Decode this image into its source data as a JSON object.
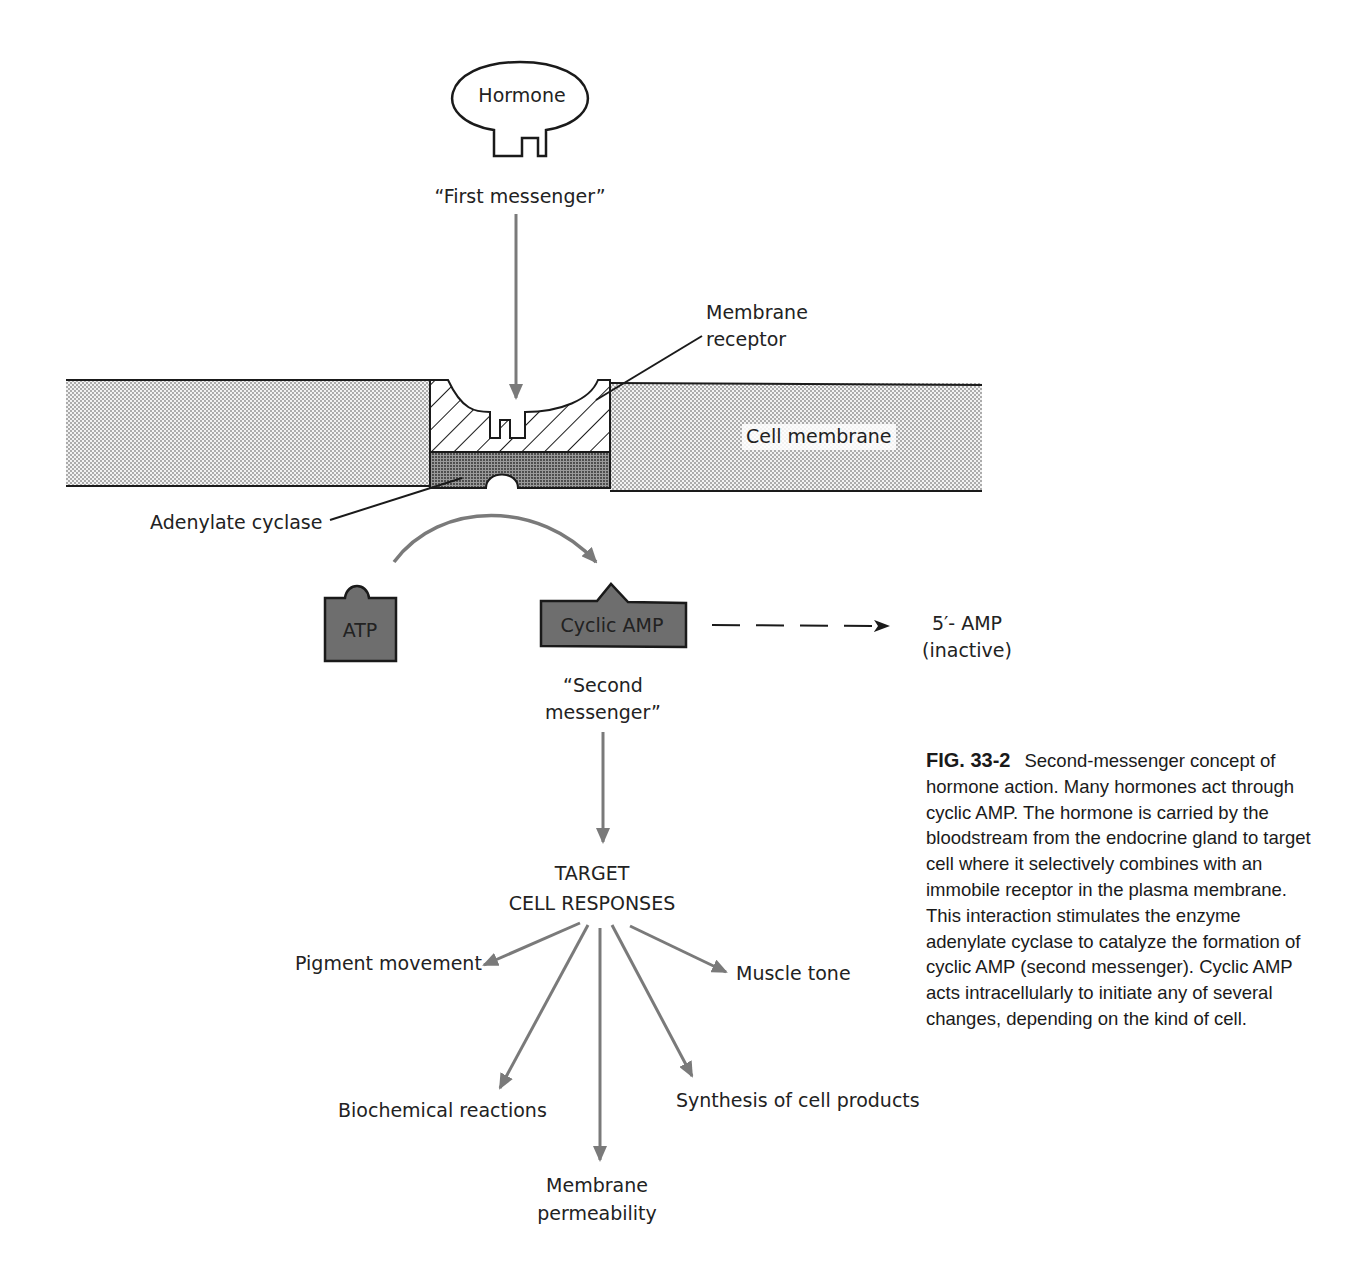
{
  "diagram": {
    "hormone_label": "Hormone",
    "first_messenger": "“First messenger”",
    "membrane_receptor_line1": "Membrane",
    "membrane_receptor_line2": "receptor",
    "cell_membrane": "Cell membrane",
    "adenylate_cyclase": "Adenylate cyclase",
    "atp": "ATP",
    "cyclic_amp": "Cyclic AMP",
    "amp_inactive_line1": "5′- AMP",
    "amp_inactive_line2": "(inactive)",
    "second_messenger_line1": "“Second",
    "second_messenger_line2": "messenger”",
    "target_line1": "TARGET",
    "target_line2": "CELL RESPONSES",
    "responses": {
      "pigment": "Pigment movement",
      "muscle": "Muscle tone",
      "biochemical": "Biochemical reactions",
      "synthesis": "Synthesis of cell products",
      "membrane_line1": "Membrane",
      "membrane_line2": "permeability"
    },
    "colors": {
      "arrow_gray": "#7a7a7a",
      "molecule_fill": "#6e6e6e",
      "stipple": "#c8c8c8",
      "outline": "#1a1a1a"
    }
  },
  "caption": {
    "fig_number": "FIG. 33-2",
    "text": "Second-messenger concept of hormone action. Many hormones act through cyclic AMP. The hormone is carried by the bloodstream from the endocrine gland to target cell where it selectively combines with an immobile receptor in the plasma membrane. This interaction stimulates the enzyme adenylate cyclase to catalyze the formation of cyclic AMP (second messenger). Cyclic AMP acts intracellularly to initiate any of several changes, depending on the kind of cell."
  }
}
